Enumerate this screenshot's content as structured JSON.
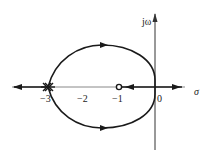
{
  "diagram": {
    "type": "root-locus",
    "axes": {
      "x_label": "σ",
      "y_label": "jω",
      "ticks": [
        {
          "value": "−3",
          "x": 48
        },
        {
          "value": "−2",
          "x": 84
        },
        {
          "value": "−1",
          "x": 119
        },
        {
          "value": "0",
          "x": 158
        }
      ]
    },
    "poles": [
      {
        "position": -3,
        "multiplicity": "multiple",
        "marker": "×"
      }
    ],
    "zeros": [
      {
        "position": -1,
        "marker": "○"
      }
    ],
    "colors": {
      "curve": "#1a1a1a",
      "axis": "#333333"
    }
  }
}
